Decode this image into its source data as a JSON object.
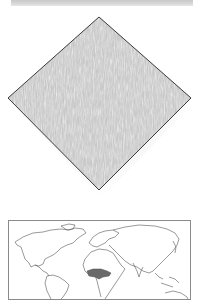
{
  "page": {
    "type": "specimen-plate"
  },
  "header_band": {
    "color": "#d2d2d2"
  },
  "specimen_swatch": {
    "shape": "diamond",
    "fill": "#c4c4c4",
    "texture": "mottled-fibrous",
    "outline": "#3a3a3a",
    "corners": {
      "top": [
        99,
        17
      ],
      "left": [
        8,
        98
      ],
      "right": [
        191,
        98
      ],
      "bottom": [
        99,
        190
      ]
    }
  },
  "distribution_map": {
    "projection": "world",
    "outline_color": "#555555",
    "highlight_color": "#6a6a6a",
    "highlighted_region": "West and Central Africa"
  }
}
